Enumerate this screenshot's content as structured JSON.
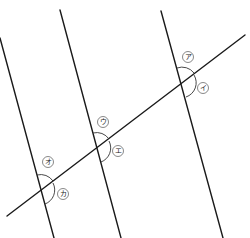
{
  "diagram": {
    "header_fragment": "",
    "lines": {
      "parallel": [
        {
          "id": "p1",
          "x1": 0,
          "y1": 38,
          "x2": 54,
          "y2": 238
        },
        {
          "id": "p2",
          "x1": 60,
          "y1": 10,
          "x2": 121,
          "y2": 238
        },
        {
          "id": "p3",
          "x1": 161,
          "y1": 11,
          "x2": 223,
          "y2": 238
        }
      ],
      "transversal": {
        "x1": 7,
        "y1": 216,
        "x2": 245,
        "y2": 35
      }
    },
    "intersections": [
      {
        "id": "right",
        "labels": [
          {
            "text": "ア",
            "cx": 188,
            "cy": 57,
            "position": "upper-left"
          },
          {
            "text": "イ",
            "cx": 203,
            "cy": 88,
            "position": "lower-right"
          }
        ]
      },
      {
        "id": "middle",
        "labels": [
          {
            "text": "ウ",
            "cx": 103,
            "cy": 122,
            "position": "upper-left"
          },
          {
            "text": "エ",
            "cx": 118,
            "cy": 151,
            "position": "lower-right"
          }
        ]
      },
      {
        "id": "left",
        "labels": [
          {
            "text": "オ",
            "cx": 48,
            "cy": 162,
            "position": "upper-left"
          },
          {
            "text": "カ",
            "cx": 63,
            "cy": 194,
            "position": "lower-right"
          }
        ]
      }
    ]
  }
}
